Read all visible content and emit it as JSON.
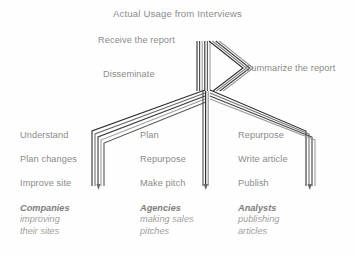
{
  "title": "Actual Usage from Interviews",
  "top_nodes": {
    "receive": "Receive the report",
    "disseminate": "Disseminate",
    "summarize": "Summarize the report"
  },
  "columns": [
    {
      "id": "companies",
      "steps": [
        "Understand",
        "Plan changes",
        "Improve site"
      ],
      "group_name": "Companies",
      "group_desc_line1": "improving",
      "group_desc_line2": "their sites"
    },
    {
      "id": "agencies",
      "steps": [
        "Plan",
        "Repurpose",
        "Make pitch"
      ],
      "group_name": "Agencies",
      "group_desc_line1": "making sales",
      "group_desc_line2": "pitches"
    },
    {
      "id": "analysts",
      "steps": [
        "Repurpose",
        "Write article",
        "Publish"
      ],
      "group_name": "Analysts",
      "group_desc_line1": "publishing",
      "group_desc_line2": "articles"
    }
  ],
  "colors": {
    "background": "#fefefe",
    "text": "#8a8a8a",
    "title": "#8c8c8c",
    "group_name": "#7d7d7d",
    "group_desc": "#9e9e9e",
    "flow_dark": "#2f2f2f",
    "flow_mid": "#565656",
    "flow_light": "#9b9b9b"
  }
}
